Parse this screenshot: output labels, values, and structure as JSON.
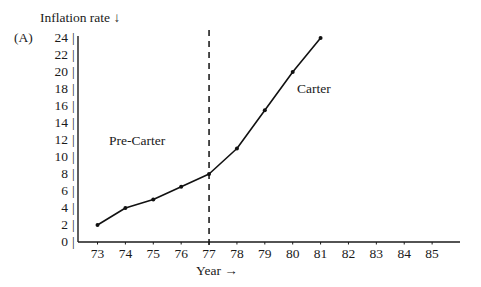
{
  "panel": {
    "label": "(A)"
  },
  "axes": {
    "y_title": "Inflation rate ↓",
    "x_title": "Year →"
  },
  "annotations": {
    "pre_carter": "Pre-Carter",
    "carter": "Carter"
  },
  "colors": {
    "ink": "#1a1a1a",
    "line": "#111111",
    "divider": "#111111"
  },
  "chart_data": {
    "type": "line",
    "title": "",
    "subtitle": "",
    "xlabel": "Year →",
    "ylabel": "Inflation rate ↓",
    "x": [
      73,
      74,
      75,
      76,
      77,
      78,
      79,
      80,
      81
    ],
    "x_tick_labels": [
      "73",
      "74",
      "75",
      "76",
      "77",
      "78",
      "79",
      "80",
      "81",
      "82",
      "83",
      "84",
      "85"
    ],
    "x_tick_values": [
      73,
      74,
      75,
      76,
      77,
      78,
      79,
      80,
      81,
      82,
      83,
      84,
      85
    ],
    "y_tick_labels": [
      "0",
      "2",
      "4",
      "6",
      "8",
      "10",
      "12",
      "14",
      "16",
      "18",
      "20",
      "22",
      "24"
    ],
    "y_tick_values": [
      0,
      2,
      4,
      6,
      8,
      10,
      12,
      14,
      16,
      18,
      20,
      22,
      24
    ],
    "series": [
      {
        "name": "Inflation rate",
        "values": [
          2.0,
          4.0,
          5.0,
          6.5,
          8.0,
          11.0,
          15.5,
          20.0,
          24.0
        ],
        "marker": "dot"
      }
    ],
    "xlim": [
      72.3,
      86.0
    ],
    "ylim": [
      0,
      24
    ],
    "grid": false,
    "legend": false,
    "legend_position": "none",
    "annotations": [
      {
        "text": "Pre-Carter",
        "x": 75.0,
        "y": 12.0,
        "type": "region-label"
      },
      {
        "text": "Carter",
        "x": 79.6,
        "y": 18.6,
        "type": "region-label"
      },
      {
        "text": "",
        "x": 77,
        "y": 24,
        "type": "vertical-dashed-divider"
      }
    ],
    "divider_x": 77
  }
}
